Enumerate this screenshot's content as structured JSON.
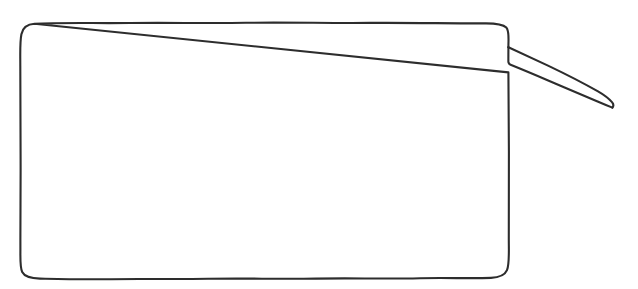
{
  "canvas": {
    "width": 638,
    "height": 289,
    "background_color": "#ffffff"
  },
  "artwork": {
    "name": "hand-drawn-speech-balloon",
    "description": "Empty hand-drawn speech balloon outline with a long thin pointer tail on the right side",
    "style": "hand-drawn ink outline",
    "stroke_color": "#2d2d2d",
    "stroke_width": 2.1,
    "fill_color": "#ffffff"
  },
  "balloon": {
    "body": {
      "left": 20,
      "top": 23,
      "right": 510,
      "bottom": 279,
      "corner_radius": 14
    },
    "tail": {
      "upper_anchor_x": 508,
      "upper_anchor_y": 47,
      "lower_anchor_x": 508,
      "lower_anchor_y": 72,
      "tip_x": 612,
      "tip_y": 108
    },
    "caption_text": ""
  },
  "paths": {
    "body_outline": "M 34.5 23.8 C 60 22.4 96 23.4 130 23.0 C 168 22.5 206 23.4 246 22.8 C 288 22.2 330 23.3 370 22.9 C 410 22.5 452 23.6 486 23.4 C 496 23.4 503 24.2 506.3 27.6 C 508.6 30.0 508.6 36.4 508.5 41.2 C 508.4 44.0 508.4 45.8 508.4 47.2 M 508.4 72.4 C 508.4 96 508.8 124 508.9 152 C 509.0 182 508.7 212 508.8 240 C 508.9 256 509.4 264.6 507.0 270.2 C 504.6 275.8 499.0 277.6 491.0 277.9 C 470 278.6 446 277.6 420 278.2 C 386 279.0 350 278.0 316 278.6 C 280 279.2 244 278.2 208 278.8 C 172 279.4 138 278.6 104 279.2 C 80 279.6 58 279.0 40 278.6 C 31 278.4 24.6 276.8 22.2 272.0 C 20.0 267.6 20.4 259 20.4 250 C 20.3 220 20.7 190 20.6 160 C 20.5 128 20.2 96 20.3 66 C 20.3 52 19.8 42 21.4 34.2 C 22.8 27.4 27.2 24.2 34.5 23.8 Z",
    "tail_upper": "M 508.4 47.2 C 520 52.6 534 59.0 548 65.6 C 566 74.2 584 83.4 598 91.4 C 605 95.4 609.6 99.4 612.2 102.4 C 613.6 104.2 613.8 106.0 612.4 107.6",
    "tail_lower": "M 612.4 107.6 C 609.4 106.4 604 104.2 597 101.2 C 582 94.8 564 87.2 547 80.0 C 532 73.6 519 68.2 510.6 64.8 C 509.2 64.2 508.5 63.4 508.4 62.2 C 508.3 59.2 508.4 54.6 508.4 50.0 C 508.4 49.0 508.4 48.0 508.4 47.2"
  }
}
